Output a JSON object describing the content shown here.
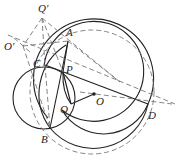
{
  "diagram": {
    "type": "geometry",
    "points": [
      {
        "name": "Q'",
        "x": 42,
        "y": 18
      },
      {
        "name": "O'",
        "x": 23,
        "y": 46
      },
      {
        "name": "A",
        "x": 68,
        "y": 41
      },
      {
        "name": "C",
        "x": 45,
        "y": 65
      },
      {
        "name": "P",
        "x": 63,
        "y": 72
      },
      {
        "name": "Q",
        "x": 71,
        "y": 104
      },
      {
        "name": "O",
        "x": 94,
        "y": 94
      },
      {
        "name": "B",
        "x": 50,
        "y": 128
      },
      {
        "name": "D",
        "x": 148,
        "y": 104
      }
    ],
    "labels": {
      "Qp": "Q'",
      "Op": "O'",
      "A": "A",
      "C": "C",
      "P": "P",
      "Q": "Q",
      "O": "O",
      "B": "B",
      "D": "D"
    },
    "colors": {
      "stroke": "#222222",
      "dashed": "#777777",
      "background": "#ffffff"
    }
  }
}
